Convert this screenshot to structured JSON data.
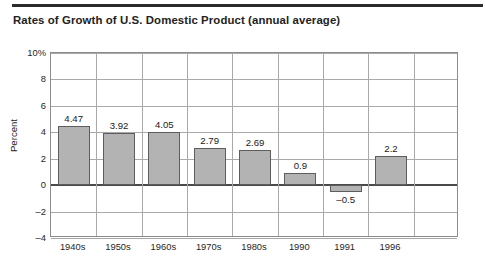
{
  "title": "Rates of Growth of U.S. Domestic Product (annual average)",
  "chart_data": {
    "type": "bar",
    "title": "Rates of Growth of U.S. Domestic Product (annual average)",
    "xlabel": "",
    "ylabel": "Percent",
    "categories": [
      "1940s",
      "1950s",
      "1960s",
      "1970s",
      "1980s",
      "1990",
      "1991",
      "1996"
    ],
    "values": [
      4.47,
      3.92,
      4.05,
      2.79,
      2.69,
      0.9,
      -0.5,
      2.2
    ],
    "value_labels": [
      "4.47",
      "3.92",
      "4.05",
      "2.79",
      "2.69",
      "0.9",
      "–0.5",
      "2.2"
    ],
    "ylim": [
      -4,
      10
    ],
    "yticks": [
      10,
      8,
      6,
      4,
      2,
      0,
      -2,
      -4
    ],
    "ytick_labels": [
      "10%",
      "8",
      "6",
      "4",
      "2",
      "0",
      "–2",
      "–4"
    ],
    "grid": true,
    "legend": false,
    "bar_color": "#b3b3b3",
    "bar_border_color": "#5d5d5d",
    "grid_color": "#a9a9a9",
    "zero_line_color": "#4a4a4a",
    "axis_color": "#8c8c8c",
    "slots": 9,
    "empty_trailing_slots": 1
  }
}
